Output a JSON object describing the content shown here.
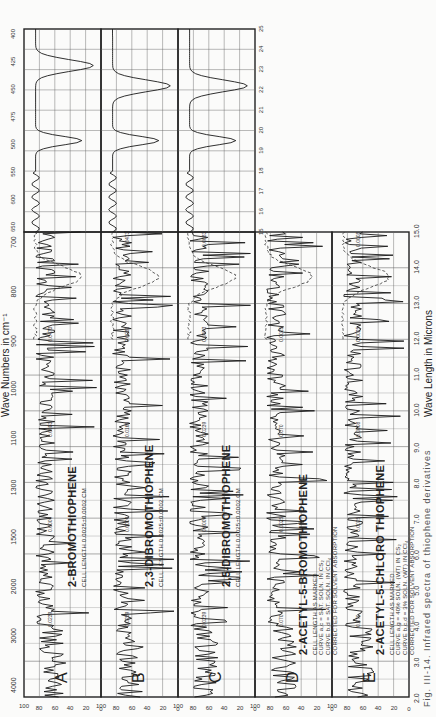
{
  "chart_data": {
    "type": "line",
    "orientation": "rotated 90 degrees counterclockwise",
    "top_axis": {
      "label": "Wave Numbers in cm⁻¹",
      "ticks_main": [
        "4000",
        "3000",
        "2000",
        "1500",
        "1300",
        "1100",
        "1000",
        "900",
        "800",
        "700"
      ],
      "ticks_extended": [
        "650",
        "600",
        "550",
        "500",
        "475",
        "450",
        "425",
        "400"
      ]
    },
    "bottom_axis": {
      "label": "Wave Length in Microns",
      "ticks_main": [
        "2.0",
        "3.0",
        "4.0",
        "5.0",
        "6.0",
        "7.0",
        "8.0",
        "9.0",
        "10.0",
        "11.0",
        "12.0",
        "13.0",
        "14.0",
        "15.0"
      ],
      "ticks_extended": [
        "15",
        "16",
        "17",
        "18",
        "19",
        "20",
        "21",
        "22",
        "23",
        "24",
        "25"
      ]
    },
    "y_axis": {
      "label": "Percent Transmission",
      "ticks": [
        "100",
        "80",
        "60",
        "40",
        "20",
        "0"
      ],
      "range": [
        0,
        100
      ]
    },
    "panels": [
      {
        "letter": "A",
        "compound": "2-BROMOTHIOPHENE",
        "cell_length": "CELL LENGTH 0.0025±0.0002 CM",
        "thickness_labels": [
          "0.0239",
          "0.0009",
          "0.0083",
          "0.0473"
        ]
      },
      {
        "letter": "B",
        "compound": "2,3-DIBROMOTHIOPHENE",
        "cell_length": "CELL LENGTH 0.0025±0.0002 CM",
        "thickness_labels": [
          "0.0239",
          "0.0009",
          "0.0165",
          "0.0083",
          "0.0473"
        ]
      },
      {
        "letter": "C",
        "compound": "2,5-DIBROMOTHIOPHENE",
        "cell_length": "CELL LENGTH 0.0025±0.0002 CM",
        "thickness_labels": [
          "0.0239",
          "0.0009",
          "0.0239",
          "0.0473",
          "0.0083"
        ]
      },
      {
        "letter": "D",
        "compound": "2-ACETYL-5-BROMOTHIOPHENE",
        "cell_length": "CELL LENGTH AS MARKED",
        "notes": [
          "CURVE a,c = SAT. SOLN. IN CS₂",
          "CURVE b,d = SAT. SOLN. IN CCl₄",
          "CORRECTED FOR SOLVENT ABSORPTION"
        ],
        "thickness_labels": [
          "0.070",
          "0.0025",
          "0.070",
          "0.0025"
        ]
      },
      {
        "letter": "E",
        "compound": "2-ACETYL-5-CHLORO THIOPHENE",
        "cell_length": "CELL LENGTH AS MARKED",
        "notes": [
          "CURVE a,g = 40% SOLN. (WT) IN CS₂",
          "CURVE b,c,d = 3% SOLN. (WT) IN CCl₄",
          "CORRECTED FOR SOLVENT ABSORPTION"
        ],
        "thickness_labels": [
          "0.070",
          "0.0025",
          "0.0008",
          "0.0025",
          "0.0008"
        ]
      }
    ],
    "grid": true
  },
  "ui": {
    "top_title": "Wave Numbers in cm⁻¹",
    "bottom_title": "Wave Length in Microns",
    "y_title": "Percent Transmission",
    "caption": "Fig. III-14. Infrared spectra of thiophene derivatives"
  }
}
